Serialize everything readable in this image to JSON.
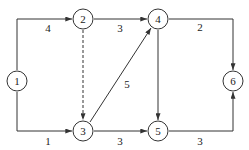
{
  "diagram": {
    "type": "network-graph",
    "nodes": [
      {
        "id": "1",
        "label": "1",
        "x": 17,
        "y": 81
      },
      {
        "id": "2",
        "label": "2",
        "x": 83,
        "y": 19
      },
      {
        "id": "3",
        "label": "3",
        "x": 83,
        "y": 131
      },
      {
        "id": "4",
        "label": "4",
        "x": 158,
        "y": 19
      },
      {
        "id": "5",
        "label": "5",
        "x": 158,
        "y": 131
      },
      {
        "id": "6",
        "label": "6",
        "x": 233,
        "y": 81
      }
    ],
    "edges": [
      {
        "from": "1",
        "to": "2",
        "weight": "4",
        "style": "solid"
      },
      {
        "from": "1",
        "to": "3",
        "weight": "1",
        "style": "solid"
      },
      {
        "from": "2",
        "to": "4",
        "weight": "3",
        "style": "solid"
      },
      {
        "from": "2",
        "to": "3",
        "weight": "",
        "style": "dashed"
      },
      {
        "from": "3",
        "to": "4",
        "weight": "5",
        "style": "solid"
      },
      {
        "from": "3",
        "to": "5",
        "weight": "3",
        "style": "solid"
      },
      {
        "from": "4",
        "to": "5",
        "weight": "",
        "style": "solid"
      },
      {
        "from": "4",
        "to": "6",
        "weight": "2",
        "style": "solid"
      },
      {
        "from": "5",
        "to": "6",
        "weight": "3",
        "style": "solid"
      }
    ],
    "edge_labels": {
      "e12": "4",
      "e13": "1",
      "e24": "3",
      "e34": "5",
      "e35": "3",
      "e46": "2",
      "e56": "3"
    },
    "node_labels": {
      "n1": "1",
      "n2": "2",
      "n3": "3",
      "n4": "4",
      "n5": "5",
      "n6": "6"
    },
    "colors": {
      "stroke": "#333333",
      "background": "#ffffff"
    }
  }
}
